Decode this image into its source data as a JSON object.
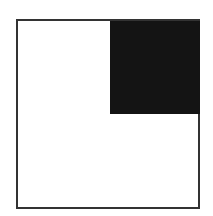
{
  "diagram": {
    "outer_square": {
      "fill": "#ffffff",
      "stroke": "#333333"
    },
    "shaded_region": {
      "position": "top-right",
      "fraction": "1/4",
      "fill": "#141414"
    }
  }
}
